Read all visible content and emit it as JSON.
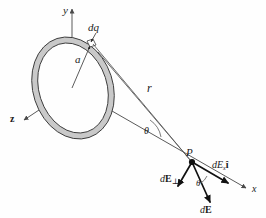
{
  "figure": {
    "background_color": "#fefefe",
    "ring_fill_color": "#c9c9c9",
    "ring_stroke_color": "#3b3b3b",
    "line_color": "#5a5a5a",
    "vector_color": "#111111"
  },
  "axes": [
    {
      "id": "y",
      "label": "y",
      "direction": "up",
      "label_x": 63,
      "label_y": 14
    },
    {
      "id": "z",
      "label": "z",
      "direction": "down-left",
      "label_x": 10,
      "label_y": 122
    },
    {
      "id": "x",
      "label": "x",
      "direction": "down-right",
      "label_x": 252,
      "label_y": 192
    }
  ],
  "labels": {
    "charge_element": "dq",
    "radius": "a",
    "distance": "r",
    "angle_at_ring": "θ",
    "angle_at_point": "θ",
    "field_point": "P"
  },
  "vectors": [
    {
      "id": "dE-perp",
      "label_main": "d",
      "label_bold": "E",
      "label_sub": "⊥",
      "description": "perpendicular component of the field at P, pointing down-left",
      "label_x": 166,
      "label_y": 181
    },
    {
      "id": "dE-x-ihat",
      "label_main": "dE",
      "label_sub": "x",
      "label_bold": "î",
      "description": "axial x-component of the field at P, pointing down-right along x",
      "label_x": 214,
      "label_y": 168
    },
    {
      "id": "dE-total",
      "label_main": "d",
      "label_bold": "E",
      "label_sub": "",
      "description": "total differential field at P, pointing down-right",
      "label_x": 205,
      "label_y": 212
    }
  ],
  "geometry": {
    "origin": {
      "x": 72,
      "y": 88
    },
    "field_point_P": {
      "x": 192,
      "y": 162
    },
    "dq_point": {
      "x": 92,
      "y": 44
    },
    "ring_center": {
      "x": 73,
      "y": 88
    },
    "ring_rx": 38,
    "ring_ry": 50,
    "ring_rotation_deg": -18,
    "ring_band_width": 6
  }
}
